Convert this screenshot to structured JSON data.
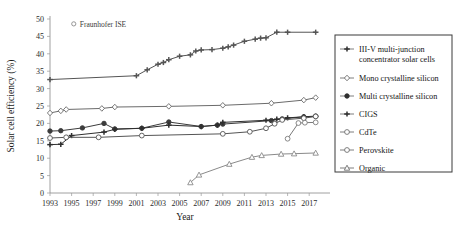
{
  "chart_data": {
    "type": "line",
    "title": "",
    "xlabel": "Year",
    "ylabel": "Solar cell efficiency (%)",
    "xlim": [
      1993,
      2018
    ],
    "ylim": [
      0,
      50
    ],
    "ytick_step": 5,
    "yticks": [
      0,
      5,
      10,
      15,
      20,
      25,
      30,
      35,
      40,
      45,
      50
    ],
    "xticks": [
      1993,
      1995,
      1997,
      1999,
      2001,
      2003,
      2005,
      2007,
      2009,
      2011,
      2013,
      2015,
      2017
    ],
    "grid": false,
    "legend_position": "right-outside",
    "annotations": [
      {
        "text": "Fraunhofer ISE",
        "marker": "open-circle",
        "x": 1995.2,
        "y": 48.6
      }
    ],
    "series": [
      {
        "name": "III-V multi-junction concentrator solar cells",
        "marker": "plus-filled",
        "color": "#555555",
        "x": [
          1993,
          2001,
          2002,
          2003,
          2003.5,
          2004,
          2005,
          2006,
          2006.5,
          2007,
          2008,
          2009,
          2009.5,
          2010,
          2011,
          2012,
          2012.5,
          2013,
          2014,
          2015,
          2017.6
        ],
        "values": [
          32.6,
          33.7,
          35.4,
          37.0,
          37.5,
          38.3,
          39.3,
          39.7,
          40.8,
          41.1,
          41.2,
          41.6,
          42.0,
          42.5,
          43.6,
          44.2,
          44.5,
          44.6,
          46.2,
          46.2,
          46.2
        ]
      },
      {
        "name": "Mono crystalline silicon",
        "marker": "open-diamond",
        "color": "#6b6b6b",
        "x": [
          1993,
          1994,
          1994.5,
          1997.8,
          1999,
          2004,
          2009,
          2013.5,
          2016.5,
          2017.6
        ],
        "values": [
          23.0,
          23.6,
          24.0,
          24.3,
          24.7,
          24.9,
          25.2,
          25.8,
          26.7,
          27.4
        ]
      },
      {
        "name": "Multi crystalline silicon",
        "marker": "filled-circle",
        "color": "#3c3c3c",
        "x": [
          1993,
          1994,
          1996,
          1998,
          1999,
          2001.5,
          2004,
          2007,
          2008.5,
          2009,
          2013.5,
          2014.5,
          2016.5,
          2017.6
        ],
        "values": [
          17.8,
          17.9,
          18.7,
          20.0,
          18.4,
          18.6,
          20.4,
          19.1,
          19.5,
          19.8,
          20.8,
          21.3,
          21.9,
          22.1
        ]
      },
      {
        "name": "CIGS",
        "marker": "plus-filled",
        "color": "#2f2f2f",
        "x": [
          1993,
          1994,
          1995,
          1998,
          1999,
          2001.5,
          2004,
          2007,
          2008.5,
          2009,
          2013,
          2014,
          2015,
          2016.5,
          2017.6
        ],
        "values": [
          13.9,
          14.0,
          16.5,
          17.5,
          18.3,
          18.6,
          19.5,
          19.1,
          19.5,
          20.3,
          20.9,
          21.2,
          21.6,
          21.9,
          22.0
        ]
      },
      {
        "name": "CdTe",
        "marker": "open-circle",
        "color": "#555555",
        "x": [
          1993,
          1994.5,
          1997.5,
          2001.5,
          2009,
          2011.5,
          2013,
          2013.8,
          2014.5,
          2016.5,
          2017.6
        ],
        "values": [
          15.8,
          16.0,
          16.0,
          16.5,
          17.0,
          17.6,
          18.6,
          19.9,
          21.0,
          21.5,
          22.0
        ]
      },
      {
        "name": "Perovskite",
        "marker": "open-circle",
        "color": "#7a7a7a",
        "x": [
          2015,
          2016,
          2016.6,
          2017.6
        ],
        "values": [
          15.6,
          20.1,
          20.2,
          20.3
        ]
      },
      {
        "name": "Organic",
        "marker": "open-triangle",
        "color": "#8a8a8a",
        "x": [
          2006,
          2006.8,
          2009.6,
          2011.7,
          2012.6,
          2014.4,
          2015.6,
          2017.6
        ],
        "values": [
          3.0,
          5.2,
          8.3,
          10.3,
          10.8,
          11.2,
          11.3,
          11.5
        ]
      }
    ]
  },
  "legend": {
    "items": [
      {
        "label": "III-V multi-junction",
        "label2": "concentrator solar cells",
        "marker": "plus-filled"
      },
      {
        "label": "Mono crystalline silicon",
        "label2": "",
        "marker": "open-diamond"
      },
      {
        "label": "Multi crystalline silicon",
        "label2": "",
        "marker": "filled-circle"
      },
      {
        "label": "CIGS",
        "label2": "",
        "marker": "plus-filled"
      },
      {
        "label": "CdTe",
        "label2": "",
        "marker": "open-circle"
      },
      {
        "label": "Perovskite",
        "label2": "",
        "marker": "open-circle"
      },
      {
        "label": "Organic",
        "label2": "",
        "marker": "open-triangle"
      }
    ]
  },
  "colors": {
    "axis": "#888888",
    "text": "#1a1a1a",
    "legend_border": "#3b3b3b",
    "background": "#ffffff"
  }
}
